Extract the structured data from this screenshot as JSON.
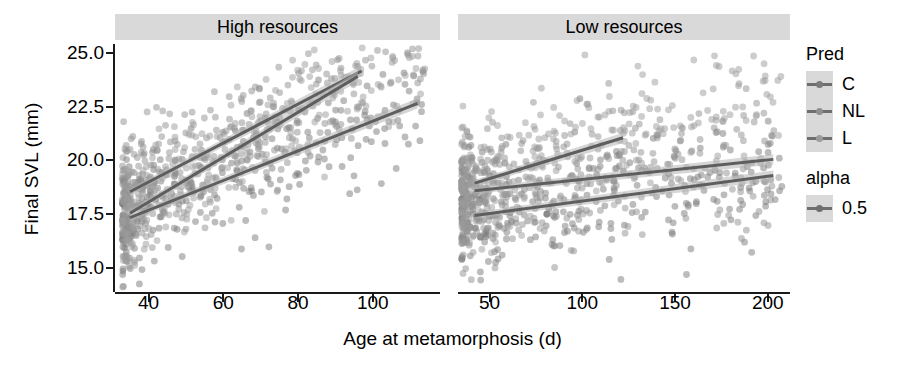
{
  "chart_data": {
    "type": "scatter",
    "title": "",
    "xlabel": "Age at metamorphosis (d)",
    "ylabel": "Final SVL (mm)",
    "grid": false,
    "legend_position": "right",
    "facets": [
      {
        "label": "High resources",
        "xlim": [
          31,
          118
        ],
        "ylim": [
          13.9,
          25.4
        ],
        "xticks": [
          40,
          60,
          80,
          100
        ],
        "n_points": 860,
        "series": [
          {
            "name": "C",
            "color": "#7a7a7a",
            "fit": {
              "x": [
                35,
                112
              ],
              "y": [
                17.35,
                22.65
              ]
            },
            "point_spread": 1.35,
            "n": 300
          },
          {
            "name": "NL",
            "color": "#8f8f8f",
            "fit": {
              "x": [
                35,
                97
              ],
              "y": [
                18.55,
                24.15
              ]
            },
            "point_spread": 1.5,
            "n": 280
          },
          {
            "name": "L",
            "color": "#9c9c9c",
            "fit": {
              "x": [
                35,
                96
              ],
              "y": [
                17.55,
                23.9
              ]
            },
            "point_spread": 1.45,
            "n": 280
          }
        ]
      },
      {
        "label": "Low resources",
        "xlim": [
          33,
          212
        ],
        "ylim": [
          13.9,
          25.4
        ],
        "xticks": [
          50,
          100,
          150,
          200
        ],
        "n_points": 900,
        "series": [
          {
            "name": "C",
            "color": "#7a7a7a",
            "fit": {
              "x": [
                42,
                203
              ],
              "y": [
                17.45,
                19.3
              ]
            },
            "point_spread": 1.45,
            "n": 320
          },
          {
            "name": "NL",
            "color": "#8f8f8f",
            "fit": {
              "x": [
                42,
                203
              ],
              "y": [
                18.6,
                20.05
              ]
            },
            "point_spread": 1.55,
            "n": 300
          },
          {
            "name": "L",
            "color": "#9c9c9c",
            "fit": {
              "x": [
                42,
                122
              ],
              "y": [
                18.95,
                21.05
              ]
            },
            "point_spread": 1.5,
            "n": 280
          }
        ]
      }
    ],
    "yticks": [
      15.0,
      17.5,
      20.0,
      22.5,
      25.0
    ],
    "ytick_labels": [
      "15.0",
      "17.5",
      "20.0",
      "22.5",
      "25.0"
    ]
  },
  "axes": {
    "y_title": "Final SVL (mm)",
    "x_title": "Age at metamorphosis (d)",
    "y_tick_labels": [
      "25.0",
      "22.5",
      "20.0",
      "17.5",
      "15.0"
    ],
    "left_x_tick_labels": [
      "40",
      "60",
      "80",
      "100"
    ],
    "right_x_tick_labels": [
      "50",
      "100",
      "150",
      "200"
    ]
  },
  "panels": {
    "left_strip_label": "High resources",
    "right_strip_label": "Low resources",
    "strip_background": "#d9d9d9"
  },
  "legend": {
    "pred": {
      "title": "Pred",
      "items": [
        {
          "label": "C",
          "color": "#7a7a7a"
        },
        {
          "label": "NL",
          "color": "#8f8f8f"
        },
        {
          "label": "L",
          "color": "#9c9c9c"
        }
      ]
    },
    "alpha": {
      "title": "alpha",
      "items": [
        {
          "label": "0.5",
          "color": "#6e6e6e"
        }
      ]
    },
    "key_background": "#d9d9d9"
  }
}
